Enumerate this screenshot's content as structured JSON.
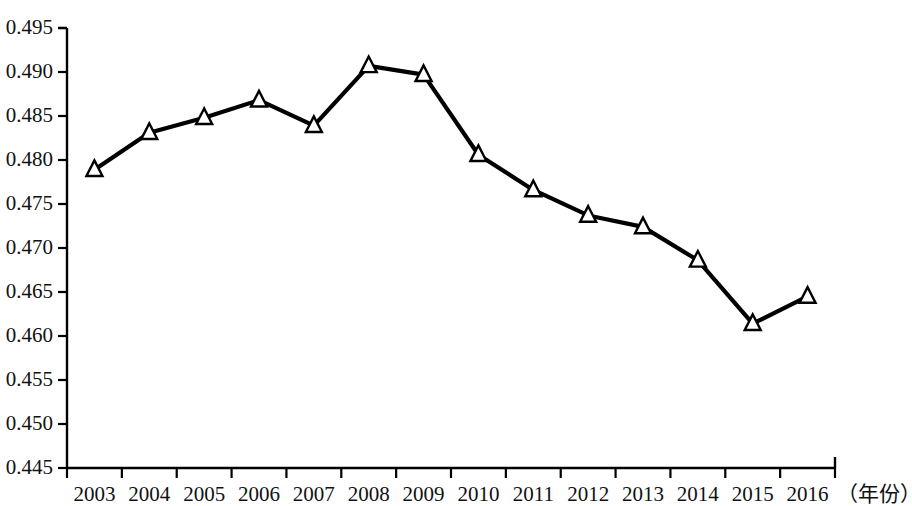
{
  "chart_data": {
    "type": "line",
    "title": "",
    "subtitle": "",
    "xlabel": "（年份）",
    "ylabel": "",
    "categories": [
      "2003",
      "2004",
      "2005",
      "2006",
      "2007",
      "2008",
      "2009",
      "2010",
      "2011",
      "2012",
      "2013",
      "2014",
      "2015",
      "2016"
    ],
    "values": [
      0.4789,
      0.4831,
      0.4848,
      0.4868,
      0.4839,
      0.4907,
      0.4897,
      0.4806,
      0.4766,
      0.4737,
      0.4724,
      0.4686,
      0.4614,
      0.4645
    ],
    "series": [
      {
        "name": "",
        "values": [
          0.4789,
          0.4831,
          0.4848,
          0.4868,
          0.4839,
          0.4907,
          0.4897,
          0.4806,
          0.4766,
          0.4737,
          0.4724,
          0.4686,
          0.4614,
          0.4645
        ]
      }
    ],
    "ylim": [
      0.445,
      0.495
    ],
    "xlim": [
      0,
      14
    ],
    "ytick_labels": [
      "0.495",
      "0.490",
      "0.485",
      "0.480",
      "0.475",
      "0.470",
      "0.465",
      "0.460",
      "0.455",
      "0.450",
      "0.445"
    ],
    "ytick_values": [
      0.495,
      0.49,
      0.485,
      0.48,
      0.475,
      0.47,
      0.465,
      0.46,
      0.455,
      0.45,
      0.445
    ],
    "grid": false,
    "legend": null,
    "legend_position": "none",
    "marker": "open-triangle",
    "line_color": "#000000",
    "marker_fill": "#ffffff",
    "marker_edge": "#000000",
    "axis_color": "#000000",
    "background": "#ffffff"
  }
}
